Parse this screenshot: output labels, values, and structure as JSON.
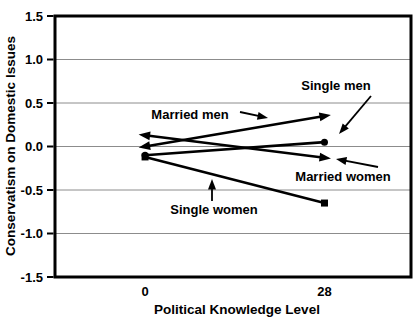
{
  "figure": {
    "background": "#ffffff",
    "ink_color": "#000000",
    "grid_color": "#8c8c8c"
  },
  "chart_data": {
    "type": "line",
    "title": "",
    "xlabel": "Political Knowledge Level",
    "ylabel": "Conservatism on Domestic Issues",
    "x_categories": [
      "0",
      "28"
    ],
    "x_values": [
      0,
      28
    ],
    "ylim": [
      -1.5,
      1.5
    ],
    "ytick_labels": [
      "1.5",
      "1.0",
      "0.5",
      "0.0",
      "-0.5",
      "-1.0",
      "-1.5"
    ],
    "ytick_values": [
      1.5,
      1.0,
      0.5,
      0.0,
      -0.5,
      -1.0,
      -1.5
    ],
    "grid": true,
    "legend": "direct-line-labels-with-arrows",
    "series": [
      {
        "name": "Married men",
        "values": [
          0.0,
          0.35
        ],
        "marker": "triangle"
      },
      {
        "name": "Married women",
        "values": [
          0.13,
          -0.13
        ],
        "marker": "triangle"
      },
      {
        "name": "Single men",
        "values": [
          -0.1,
          0.05
        ],
        "marker": "circle"
      },
      {
        "name": "Single women",
        "values": [
          -0.12,
          -0.65
        ],
        "marker": "square"
      }
    ],
    "annotations": [
      {
        "text": "Married men",
        "label_x": 190,
        "label_y": 114,
        "arrow_from": [
          240,
          112
        ],
        "arrow_to": [
          268,
          118
        ]
      },
      {
        "text": "Single men",
        "label_x": 336,
        "label_y": 85,
        "arrow_from": [
          371,
          96
        ],
        "arrow_to": [
          339,
          134
        ]
      },
      {
        "text": "Married women",
        "label_x": 343,
        "label_y": 176,
        "arrow_from": [
          378,
          167
        ],
        "arrow_to": [
          336,
          159
        ]
      },
      {
        "text": "Single women",
        "label_x": 214,
        "label_y": 209,
        "arrow_from": [
          212,
          201
        ],
        "arrow_to": [
          212,
          179
        ]
      }
    ]
  }
}
